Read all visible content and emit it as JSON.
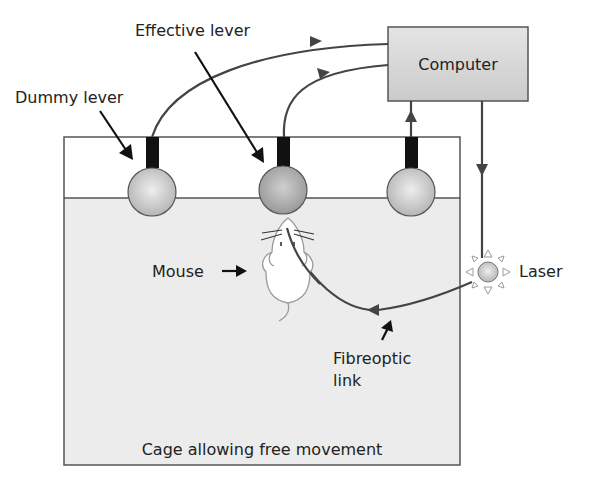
{
  "diagram": {
    "labels": {
      "computer": "Computer",
      "effective_lever": "Effective lever",
      "dummy_lever": "Dummy lever",
      "mouse": "Mouse",
      "laser": "Laser",
      "fibreoptic_line1": "Fibreoptic",
      "fibreoptic_line2": "link",
      "cage": "Cage allowing free movement"
    },
    "nodes": [
      {
        "id": "computer",
        "type": "box"
      },
      {
        "id": "dummy-lever",
        "type": "lever"
      },
      {
        "id": "effective-lever",
        "type": "lever"
      },
      {
        "id": "third-lever",
        "type": "lever"
      },
      {
        "id": "laser",
        "type": "light-source"
      },
      {
        "id": "mouse",
        "type": "animal"
      },
      {
        "id": "cage",
        "type": "enclosure"
      }
    ],
    "edges": [
      {
        "from": "dummy-lever",
        "to": "computer"
      },
      {
        "from": "effective-lever",
        "to": "computer"
      },
      {
        "from": "third-lever",
        "to": "computer"
      },
      {
        "from": "computer",
        "to": "laser"
      },
      {
        "from": "laser",
        "to": "mouse",
        "label": "Fibreoptic link"
      }
    ],
    "colors": {
      "line": "#444444",
      "lever": "#111111",
      "ball_fill": "#c4c4c4",
      "effective_ball_fill": "#a9a9a9",
      "computer_fill": "#d6d6d6",
      "cage_body": "#ededed",
      "cage_top": "#ffffff"
    }
  }
}
